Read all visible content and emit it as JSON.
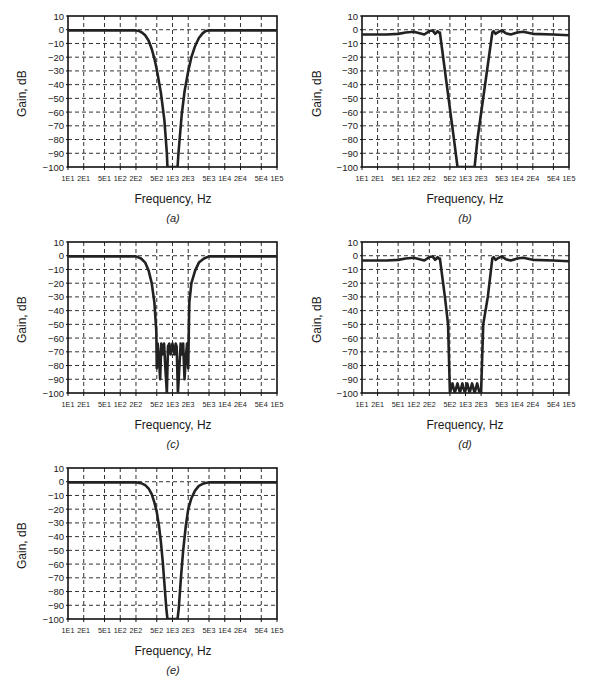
{
  "figure": {
    "common": {
      "ylabel": "Gain, dB",
      "xlabel": "Frequency, Hz",
      "yticks": [
        10,
        0,
        -10,
        -20,
        -30,
        -40,
        -50,
        -60,
        -70,
        -80,
        -90,
        -100
      ],
      "ytick_labels": [
        "10",
        "0",
        "−10",
        "−20",
        "−30",
        "−40",
        "−50",
        "−60",
        "−70",
        "−80",
        "−90",
        "−100"
      ],
      "xticks": [
        10,
        20,
        50,
        100,
        200,
        500,
        1000,
        2000,
        5000,
        10000,
        20000,
        50000,
        100000
      ],
      "xtick_labels": [
        "1E1",
        "2E1",
        "5E1",
        "1E2",
        "2E2",
        "5E2",
        "1E3",
        "2E3",
        "5E3",
        "1E4",
        "2E4",
        "5E4",
        "1E5"
      ],
      "line_color": "#222222",
      "grid_color": "#333333"
    },
    "panels": [
      {
        "id": "a",
        "label": "(a)"
      },
      {
        "id": "b",
        "label": "(b)"
      },
      {
        "id": "c",
        "label": "(c)"
      },
      {
        "id": "d",
        "label": "(d)"
      },
      {
        "id": "e",
        "label": "(e)"
      }
    ]
  },
  "chart_data": [
    {
      "type": "line",
      "title": "(a)",
      "xlabel": "Frequency, Hz",
      "ylabel": "Gain, dB",
      "xscale": "log",
      "xlim": [
        10,
        100000
      ],
      "ylim": [
        -100,
        10
      ],
      "grid": true,
      "series": [
        {
          "name": "Band-reject response (a)",
          "x": [
            10,
            100,
            200,
            230,
            260,
            300,
            350,
            400,
            450,
            500,
            600,
            700,
            780,
            800,
            1250,
            1300,
            1500,
            1700,
            2000,
            2300,
            2700,
            3200,
            3800,
            4300,
            4800,
            10000,
            100000
          ],
          "y": [
            -0.5,
            -0.5,
            -0.5,
            -1,
            -2,
            -4,
            -8,
            -14,
            -21,
            -29,
            -46,
            -66,
            -90,
            -100,
            -100,
            -90,
            -62,
            -45,
            -30,
            -20,
            -12,
            -6,
            -2.5,
            -1,
            -0.5,
            -0.5,
            -0.5
          ]
        }
      ]
    },
    {
      "type": "line",
      "title": "(b)",
      "xlabel": "Frequency, Hz",
      "ylabel": "Gain, dB",
      "xscale": "log",
      "xlim": [
        10,
        100000
      ],
      "ylim": [
        -100,
        10
      ],
      "grid": true,
      "series": [
        {
          "name": "Band-reject response (b)",
          "x": [
            10,
            30,
            50,
            70,
            100,
            130,
            160,
            200,
            230,
            260,
            290,
            300,
            320,
            600,
            700,
            1500,
            1700,
            3300,
            3500,
            3800,
            4200,
            5000,
            6000,
            7500,
            10000,
            13000,
            20000,
            50000,
            100000
          ],
          "y": [
            -3.5,
            -3.5,
            -3,
            -2,
            -1.5,
            -2.5,
            -3.5,
            -1,
            -0.5,
            -3,
            -1,
            -2,
            -2,
            -80,
            -100,
            -100,
            -80,
            -2,
            -1,
            -3,
            -2,
            -0.5,
            -2.5,
            -3.5,
            -2,
            -1.5,
            -3,
            -3.5,
            -4
          ]
        }
      ]
    },
    {
      "type": "line",
      "title": "(c)",
      "xlabel": "Frequency, Hz",
      "ylabel": "Gain, dB",
      "xscale": "log",
      "xlim": [
        10,
        100000
      ],
      "ylim": [
        -100,
        10
      ],
      "grid": true,
      "series": [
        {
          "name": "Band-reject response (c)",
          "x": [
            10,
            150,
            200,
            250,
            300,
            350,
            400,
            450,
            490,
            500,
            520,
            550,
            580,
            610,
            640,
            690,
            730,
            780,
            820,
            870,
            920,
            1000,
            1080,
            1150,
            1200,
            1270,
            1350,
            1430,
            1520,
            1600,
            1700,
            1800,
            1900,
            2000,
            2050,
            2100,
            2300,
            2700,
            3200,
            4000,
            5000,
            10000,
            100000
          ],
          "y": [
            -0.5,
            -0.5,
            -0.5,
            -2,
            -5,
            -11,
            -20,
            -34,
            -55,
            -82,
            -64,
            -74,
            -90,
            -64,
            -72,
            -64,
            -82,
            -100,
            -66,
            -64,
            -72,
            -64,
            -72,
            -64,
            -66,
            -100,
            -82,
            -64,
            -72,
            -64,
            -90,
            -74,
            -64,
            -82,
            -55,
            -34,
            -20,
            -11,
            -5,
            -2,
            -0.5,
            -0.5,
            -0.5
          ]
        }
      ]
    },
    {
      "type": "line",
      "title": "(d)",
      "xlabel": "Frequency, Hz",
      "ylabel": "Gain, dB",
      "xscale": "log",
      "xlim": [
        10,
        100000
      ],
      "ylim": [
        -100,
        10
      ],
      "grid": true,
      "series": [
        {
          "name": "Band-reject response (d)",
          "x": [
            10,
            30,
            50,
            70,
            100,
            130,
            160,
            200,
            230,
            260,
            290,
            300,
            320,
            400,
            460,
            500,
            560,
            620,
            700,
            780,
            870,
            970,
            1080,
            1200,
            1340,
            1500,
            1680,
            1870,
            2000,
            2200,
            2700,
            3300,
            3500,
            3800,
            4200,
            5000,
            6000,
            7500,
            10000,
            13000,
            20000,
            50000,
            100000
          ],
          "y": [
            -3.5,
            -3.5,
            -3,
            -2,
            -1.5,
            -2.5,
            -3.5,
            -1,
            -0.5,
            -3,
            -1,
            -2,
            -2,
            -30,
            -50,
            -100,
            -93,
            -100,
            -93,
            -100,
            -93,
            -100,
            -93,
            -100,
            -93,
            -100,
            -93,
            -100,
            -100,
            -50,
            -30,
            -2,
            -1,
            -3,
            -2,
            -0.5,
            -2.5,
            -3.5,
            -2,
            -1.5,
            -3,
            -3.5,
            -4
          ]
        }
      ]
    },
    {
      "type": "line",
      "title": "(e)",
      "xlabel": "Frequency, Hz",
      "ylabel": "Gain, dB",
      "xscale": "log",
      "xlim": [
        10,
        100000
      ],
      "ylim": [
        -100,
        10
      ],
      "grid": true,
      "series": [
        {
          "name": "Band-reject response (e)",
          "x": [
            10,
            150,
            200,
            250,
            300,
            350,
            400,
            450,
            500,
            550,
            600,
            650,
            700,
            760,
            800,
            1250,
            1320,
            1450,
            1600,
            1800,
            2000,
            2300,
            2700,
            3200,
            3800,
            4500,
            5000,
            10000,
            100000
          ],
          "y": [
            -0.5,
            -0.5,
            -0.5,
            -1,
            -2.5,
            -5,
            -9,
            -15,
            -22,
            -32,
            -44,
            -58,
            -74,
            -92,
            -100,
            -100,
            -92,
            -70,
            -50,
            -32,
            -20,
            -12,
            -6.5,
            -3,
            -1.5,
            -0.8,
            -0.5,
            -0.5,
            -0.5
          ]
        }
      ]
    }
  ]
}
